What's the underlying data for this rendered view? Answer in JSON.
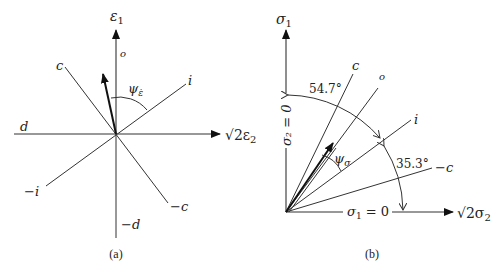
{
  "panel_a": {
    "caption": "(a)",
    "axis_vertical_label": "ε",
    "axis_vertical_sub": "1",
    "axis_horizontal_label_prefix": "√2ε",
    "axis_horizontal_sub": "2",
    "line_labels": {
      "o": "o",
      "c": "c",
      "i": "i",
      "d": "d",
      "neg_i": "−i",
      "neg_c": "−c",
      "neg_d": "−d"
    },
    "angle_label": "ψ",
    "angle_sub": "ε̇"
  },
  "panel_b": {
    "caption": "(b)",
    "axis_vertical_label": "σ",
    "axis_vertical_sub": "1",
    "axis_horizontal_label_prefix": "√2σ",
    "axis_horizontal_sub": "2",
    "vertical_axis_eq": "σ₂ = 0",
    "horizontal_axis_eq_main": "σ",
    "horizontal_axis_eq_sub": "1",
    "horizontal_axis_eq_rest": " = 0",
    "line_labels": {
      "c": "c",
      "o": "o",
      "i": "i",
      "neg_c": "−c"
    },
    "angle_label": "ψ",
    "angle_sub": "σ",
    "angle_1": "54.7°",
    "angle_2": "35.3°"
  }
}
